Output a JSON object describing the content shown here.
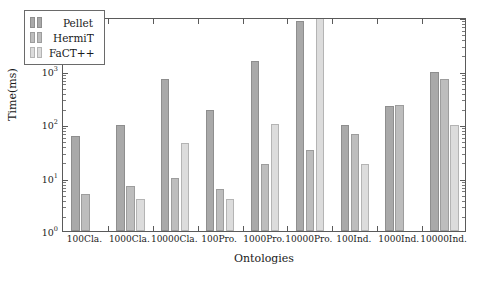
{
  "chart_data": {
    "type": "bar",
    "title": "",
    "xlabel": "Ontologies",
    "ylabel": "Time(ms)",
    "yscale": "log",
    "ylim": [
      1,
      10000
    ],
    "ytick_labels": [
      "10^0",
      "10^1",
      "10^2",
      "10^3",
      "10^4"
    ],
    "ytick_values": [
      1,
      10,
      100,
      1000,
      10000
    ],
    "grid": false,
    "legend_position": "upper-left-inside",
    "categories": [
      "100Cla.",
      "1000Cla.",
      "10000Cla.",
      "100Pro.",
      "1000Pro.",
      "10000Pro.",
      "100Ind.",
      "1000Ind.",
      "10000Ind."
    ],
    "series": [
      {
        "name": "Pellet",
        "color": "#a9a9a9",
        "values": [
          60,
          95,
          700,
          180,
          1500,
          8500,
          95,
          220,
          950
        ]
      },
      {
        "name": "HermiT",
        "color": "#bdbdbd",
        "values": [
          5,
          7,
          10,
          6,
          18,
          33,
          65,
          230,
          680
        ]
      },
      {
        "name": "FaCT++",
        "color": "#dcdcdc",
        "values": [
          0,
          4,
          45,
          4,
          100,
          13000,
          18,
          0,
          95
        ]
      }
    ]
  },
  "legend": {
    "entries": [
      {
        "label": "Pellet"
      },
      {
        "label": "HermiT"
      },
      {
        "label": "FaCT++"
      }
    ]
  },
  "axes": {
    "y_title": "Time(ms)",
    "x_title": "Ontologies"
  }
}
